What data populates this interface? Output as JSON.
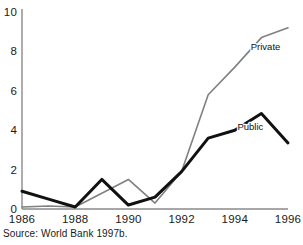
{
  "figure": {
    "source_note": "Source: World Bank 1997b."
  },
  "chart_data": {
    "type": "line",
    "title": "",
    "subtitle": "",
    "xlabel": "",
    "ylabel": "",
    "x": [
      1986,
      1987,
      1988,
      1989,
      1990,
      1991,
      1992,
      1993,
      1994,
      1995,
      1996
    ],
    "xlim": [
      1986,
      1996
    ],
    "ylim": [
      0,
      10
    ],
    "grid": false,
    "legend_position": "inline-right",
    "x_tick_labels": [
      "1986",
      "1988",
      "1990",
      "1992",
      "1994",
      "1996"
    ],
    "x_tick_values": [
      1986,
      1988,
      1990,
      1992,
      1994,
      1996
    ],
    "y_tick_labels": [
      "0",
      "2",
      "4",
      "6",
      "8",
      "10"
    ],
    "y_tick_values": [
      0,
      2,
      4,
      6,
      8,
      10
    ],
    "series": [
      {
        "name": "Private",
        "color": "#808080",
        "line_width": 1.6,
        "label": "Private",
        "label_x": 1994.6,
        "label_y": 8.05,
        "values": [
          0.1,
          0.15,
          0.1,
          0.8,
          1.5,
          0.3,
          1.9,
          5.8,
          7.2,
          8.7,
          9.2
        ]
      },
      {
        "name": "Public",
        "color": "#111111",
        "line_width": 3.0,
        "label": "Public",
        "label_x": 1994.1,
        "label_y": 4.0,
        "values": [
          0.9,
          0.5,
          0.1,
          1.5,
          0.2,
          0.6,
          1.9,
          3.6,
          4.0,
          4.85,
          3.35
        ]
      }
    ],
    "axis_color": "#8a8a8a"
  }
}
